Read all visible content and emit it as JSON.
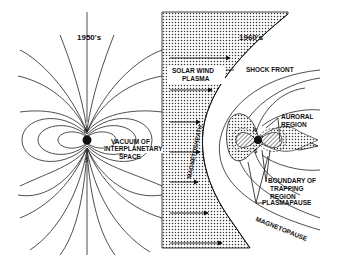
{
  "diagram": {
    "left_panel": {
      "title": "1950's",
      "pole_north": "N",
      "pole_south": "S",
      "label_line1": "VACUUM OF",
      "label_line2": "INTERPLANETARY",
      "label_line3": "SPACE"
    },
    "right_panel": {
      "title": "1960's",
      "solar_wind_line1": "SOLAR WIND",
      "solar_wind_line2": "PLASMA",
      "shock_front": "SHOCK FRONT",
      "magnetosheath": "MAGNETOSHEATH",
      "auroral_line1": "AURORAL",
      "auroral_line2": "REGION",
      "boundary_line1": "BOUNDARY OF",
      "boundary_line2": "TRAPPING",
      "boundary_line3": "REGION",
      "plasmapause": "PLASMAPAUSE",
      "magnetopause": "MAGNETOPAUSE",
      "pole_north": "N",
      "pole_south": "S"
    },
    "colors": {
      "ink": "#111111",
      "background": "#ffffff"
    }
  }
}
